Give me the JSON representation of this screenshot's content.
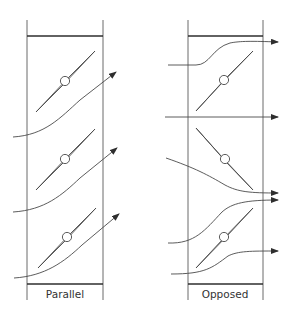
{
  "diagram": {
    "panels": [
      {
        "id": "parallel",
        "label": "Parallel",
        "blade_count": 3,
        "blade_orientation": "all angled same direction",
        "flow_description": "air deflected diagonally upward in one direction"
      },
      {
        "id": "opposed",
        "label": "Opposed",
        "blade_count": 3,
        "blade_orientation": "alternating directions",
        "flow_description": "air exits straight horizontally"
      }
    ],
    "colors": {
      "line": "#4a4a4a",
      "frame": "#6a6a6a",
      "cap": "#2e2e2e",
      "background": "#ffffff"
    }
  }
}
